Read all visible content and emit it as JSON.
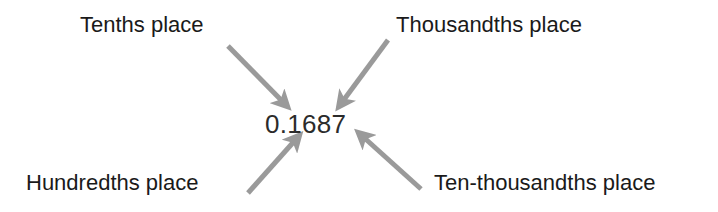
{
  "figure": {
    "background_color": "#ffffff",
    "number": {
      "value": "0.1687",
      "color": "#2b2b2b"
    },
    "arrow_color": "#9a9a9a",
    "label_color": "#1a1a1a",
    "labels": [
      {
        "id": "tenths",
        "text": "Tenths place",
        "position": "top-left"
      },
      {
        "id": "thousandths",
        "text": "Thousandths place",
        "position": "top-right"
      },
      {
        "id": "hundredths",
        "text": "Hundredths place",
        "position": "bottom-left"
      },
      {
        "id": "ten-thousandths",
        "text": "Ten-thousandths place",
        "position": "bottom-right"
      }
    ],
    "arrows": [
      {
        "id": "arrow-tenths",
        "from": "Tenths place",
        "to": "digit 1",
        "x1": 228,
        "y1": 46,
        "x2": 289,
        "y2": 108
      },
      {
        "id": "arrow-thousandths",
        "from": "Thousandths place",
        "to": "digit 8",
        "x1": 388,
        "y1": 40,
        "x2": 337,
        "y2": 109
      },
      {
        "id": "arrow-hundredths",
        "from": "Hundredths place",
        "to": "digit 6",
        "x1": 248,
        "y1": 193,
        "x2": 301,
        "y2": 133
      },
      {
        "id": "arrow-ten-thousandths",
        "from": "Ten-thousandths place",
        "to": "digit 7",
        "x1": 421,
        "y1": 189,
        "x2": 357,
        "y2": 130
      }
    ]
  }
}
